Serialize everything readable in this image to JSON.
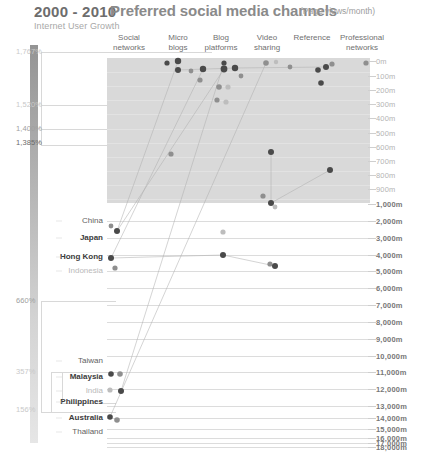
{
  "header": {
    "title": "2000 - 2010",
    "subtitle": "Internet User Growth",
    "main_title": "Preferred social media channels",
    "main_unit": "(Page views/month)"
  },
  "columns": [
    {
      "label_line1": "Social",
      "label_line2": "networks",
      "x": 129
    },
    {
      "label_line1": "Micro",
      "label_line2": "blogs",
      "x": 178
    },
    {
      "label_line1": "Blog",
      "label_line2": "platforms",
      "x": 221
    },
    {
      "label_line1": "Video",
      "label_line2": "sharing",
      "x": 267
    },
    {
      "label_line1": "Reference",
      "label_line2": "",
      "x": 312
    },
    {
      "label_line1": "Professional",
      "label_line2": "networks",
      "x": 362
    }
  ],
  "growth_axis": {
    "label": "Internet User Growth",
    "ticks": [
      {
        "value": "1,767%",
        "y": 51,
        "tone": "light"
      },
      {
        "value": "1,520%",
        "y": 104,
        "tone": "light"
      },
      {
        "value": "1,400%",
        "y": 128,
        "tone": "mid"
      },
      {
        "value": "1,385%",
        "y": 142,
        "tone": "dark"
      },
      {
        "value": "660%",
        "y": 300,
        "tone": "mid"
      },
      {
        "value": "357%",
        "y": 371,
        "tone": "light"
      },
      {
        "value": "156%",
        "y": 409,
        "tone": "light"
      }
    ]
  },
  "value_axis": {
    "unit": "m",
    "ticks": [
      {
        "label": "0m",
        "y": 61,
        "tone": "light"
      },
      {
        "label": "100m",
        "y": 76,
        "tone": "light"
      },
      {
        "label": "200m",
        "y": 90,
        "tone": "light"
      },
      {
        "label": "300m",
        "y": 104,
        "tone": "light"
      },
      {
        "label": "400m",
        "y": 118,
        "tone": "light"
      },
      {
        "label": "500m",
        "y": 133,
        "tone": "light"
      },
      {
        "label": "600m",
        "y": 147,
        "tone": "light"
      },
      {
        "label": "700m",
        "y": 161,
        "tone": "light"
      },
      {
        "label": "800m",
        "y": 175,
        "tone": "light"
      },
      {
        "label": "900m",
        "y": 189,
        "tone": "light"
      },
      {
        "label": "1,000m",
        "y": 204,
        "tone": "bold"
      },
      {
        "label": "2,000m",
        "y": 221,
        "tone": "bold"
      },
      {
        "label": "3,000m",
        "y": 238,
        "tone": "bold"
      },
      {
        "label": "4,000m",
        "y": 255,
        "tone": "bold"
      },
      {
        "label": "5,000m",
        "y": 271,
        "tone": "bold"
      },
      {
        "label": "6,000m",
        "y": 288,
        "tone": "bold"
      },
      {
        "label": "7,000m",
        "y": 305,
        "tone": "bold"
      },
      {
        "label": "8,000m",
        "y": 322,
        "tone": "bold"
      },
      {
        "label": "9,000m",
        "y": 339,
        "tone": "bold"
      },
      {
        "label": "10,000m",
        "y": 356,
        "tone": "bold"
      },
      {
        "label": "11,000m",
        "y": 372,
        "tone": "bold"
      },
      {
        "label": "12,000m",
        "y": 389,
        "tone": "bold"
      },
      {
        "label": "13,000m",
        "y": 406,
        "tone": "bold"
      },
      {
        "label": "14,000m",
        "y": 418,
        "tone": "bold"
      },
      {
        "label": "15,000m",
        "y": 429,
        "tone": "bold"
      },
      {
        "label": "16,000m",
        "y": 438,
        "tone": "bold"
      },
      {
        "label": "17,000m",
        "y": 443,
        "tone": "bold"
      },
      {
        "label": "18,000m",
        "y": 447,
        "tone": "bold"
      }
    ]
  },
  "countries": [
    {
      "name": "China",
      "y": 221,
      "tone": "mid"
    },
    {
      "name": "Japan",
      "y": 238,
      "tone": "dark"
    },
    {
      "name": "Hong Kong",
      "y": 257,
      "tone": "dark"
    },
    {
      "name": "Indonesia",
      "y": 271,
      "tone": "light"
    },
    {
      "name": "Taiwan",
      "y": 361,
      "tone": "mid"
    },
    {
      "name": "Malaysia",
      "y": 377,
      "tone": "dark"
    },
    {
      "name": "India",
      "y": 391,
      "tone": "light"
    },
    {
      "name": "Philippines",
      "y": 402,
      "tone": "dark"
    },
    {
      "name": "Australia",
      "y": 418,
      "tone": "dark"
    },
    {
      "name": "Thailand",
      "y": 432,
      "tone": "mid"
    }
  ],
  "chart_data": {
    "type": "scatter",
    "title": "Preferred social media channels",
    "subtitle": "(Page views/month)",
    "xlabel": "",
    "ylabel": "Page views/month",
    "categories": [
      "Social networks",
      "Micro blogs",
      "Blog platforms",
      "Video sharing",
      "Reference",
      "Professional networks"
    ],
    "ylim": [
      0,
      18000
    ],
    "grid": true,
    "legend": "none",
    "secondary_axis": {
      "label": "Internet User Growth 2000 - 2010",
      "values": [
        "1,767%",
        "1,520%",
        "1,400%",
        "1,385%",
        "660%",
        "357%",
        "156%"
      ]
    },
    "points": [
      {
        "cx": 167,
        "cy": 63,
        "r": 2.6,
        "tone": "dark"
      },
      {
        "cx": 178,
        "cy": 61,
        "r": 3.2,
        "tone": "dark"
      },
      {
        "cx": 178,
        "cy": 70,
        "r": 3.0,
        "tone": "dark"
      },
      {
        "cx": 191,
        "cy": 71,
        "r": 2.4,
        "tone": "mid"
      },
      {
        "cx": 203,
        "cy": 69,
        "r": 3.2,
        "tone": "dark"
      },
      {
        "cx": 200,
        "cy": 80,
        "r": 2.6,
        "tone": "mid"
      },
      {
        "cx": 224,
        "cy": 69,
        "r": 3.4,
        "tone": "dark"
      },
      {
        "cx": 224,
        "cy": 63,
        "r": 2.6,
        "tone": "dark"
      },
      {
        "cx": 235,
        "cy": 68,
        "r": 3.2,
        "tone": "dark"
      },
      {
        "cx": 219,
        "cy": 87,
        "r": 2.8,
        "tone": "mid"
      },
      {
        "cx": 228,
        "cy": 87,
        "r": 2.6,
        "tone": "light"
      },
      {
        "cx": 217,
        "cy": 100,
        "r": 2.6,
        "tone": "mid"
      },
      {
        "cx": 226,
        "cy": 102,
        "r": 2.6,
        "tone": "light"
      },
      {
        "cx": 241,
        "cy": 76,
        "r": 2.4,
        "tone": "mid"
      },
      {
        "cx": 266,
        "cy": 63,
        "r": 2.8,
        "tone": "mid"
      },
      {
        "cx": 276,
        "cy": 62,
        "r": 2.2,
        "tone": "light"
      },
      {
        "cx": 290,
        "cy": 67,
        "r": 2.4,
        "tone": "mid"
      },
      {
        "cx": 318,
        "cy": 70,
        "r": 2.8,
        "tone": "dark"
      },
      {
        "cx": 326,
        "cy": 67,
        "r": 3.0,
        "tone": "dark"
      },
      {
        "cx": 332,
        "cy": 64,
        "r": 2.6,
        "tone": "mid"
      },
      {
        "cx": 321,
        "cy": 83,
        "r": 2.8,
        "tone": "dark"
      },
      {
        "cx": 366,
        "cy": 63,
        "r": 2.6,
        "tone": "mid"
      },
      {
        "cx": 171,
        "cy": 154,
        "r": 2.6,
        "tone": "mid"
      },
      {
        "cx": 271,
        "cy": 152,
        "r": 3.0,
        "tone": "dark"
      },
      {
        "cx": 330,
        "cy": 170,
        "r": 3.0,
        "tone": "dark"
      },
      {
        "cx": 263,
        "cy": 196,
        "r": 2.6,
        "tone": "mid"
      },
      {
        "cx": 271,
        "cy": 203,
        "r": 3.0,
        "tone": "dark"
      },
      {
        "cx": 275,
        "cy": 207,
        "r": 2.4,
        "tone": "light"
      },
      {
        "cx": 111,
        "cy": 226,
        "r": 2.4,
        "tone": "mid"
      },
      {
        "cx": 117,
        "cy": 231,
        "r": 3.0,
        "tone": "dark"
      },
      {
        "cx": 223,
        "cy": 232,
        "r": 2.6,
        "tone": "light"
      },
      {
        "cx": 111,
        "cy": 258,
        "r": 3.0,
        "tone": "dark"
      },
      {
        "cx": 223,
        "cy": 255,
        "r": 3.0,
        "tone": "dark"
      },
      {
        "cx": 115,
        "cy": 268,
        "r": 2.6,
        "tone": "mid"
      },
      {
        "cx": 270,
        "cy": 264,
        "r": 2.6,
        "tone": "mid"
      },
      {
        "cx": 275,
        "cy": 266,
        "r": 3.0,
        "tone": "dark"
      },
      {
        "cx": 111,
        "cy": 374,
        "r": 2.8,
        "tone": "dark"
      },
      {
        "cx": 120,
        "cy": 374,
        "r": 2.8,
        "tone": "mid"
      },
      {
        "cx": 110,
        "cy": 390,
        "r": 2.6,
        "tone": "light"
      },
      {
        "cx": 121,
        "cy": 391,
        "r": 3.0,
        "tone": "dark"
      },
      {
        "cx": 110,
        "cy": 417,
        "r": 2.8,
        "tone": "dark"
      },
      {
        "cx": 117,
        "cy": 420,
        "r": 2.8,
        "tone": "mid"
      }
    ],
    "connections": [
      {
        "from": [
          117,
          231
        ],
        "to": [
          178,
          61
        ]
      },
      {
        "from": [
          117,
          231
        ],
        "to": [
          224,
          69
        ]
      },
      {
        "from": [
          111,
          258
        ],
        "to": [
          203,
          69
        ]
      },
      {
        "from": [
          111,
          258
        ],
        "to": [
          223,
          255
        ]
      },
      {
        "from": [
          223,
          255
        ],
        "to": [
          275,
          266
        ]
      },
      {
        "from": [
          178,
          70
        ],
        "to": [
          235,
          68
        ]
      },
      {
        "from": [
          235,
          68
        ],
        "to": [
          326,
          67
        ]
      },
      {
        "from": [
          271,
          152
        ],
        "to": [
          271,
          203
        ]
      },
      {
        "from": [
          271,
          203
        ],
        "to": [
          330,
          170
        ]
      },
      {
        "from": [
          121,
          391
        ],
        "to": [
          224,
          63
        ]
      },
      {
        "from": [
          110,
          417
        ],
        "to": [
          266,
          63
        ]
      }
    ]
  }
}
